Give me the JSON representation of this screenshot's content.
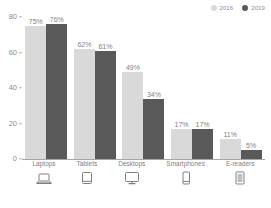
{
  "chart_data": {
    "type": "bar",
    "title": "",
    "xlabel": "",
    "ylabel": "",
    "ylim": [
      0,
      80
    ],
    "yticks": [
      0,
      20,
      40,
      60,
      80
    ],
    "grid": false,
    "legend_position": "top-right",
    "categories": [
      "Laptops",
      "Tablets",
      "Desktops",
      "Smartphones",
      "E-readers"
    ],
    "series": [
      {
        "name": "2016",
        "color": "#d9d9d9",
        "values": [
          75,
          62,
          49,
          17,
          11
        ],
        "labels": [
          "75%",
          "62%",
          "49%",
          "17%",
          "11%"
        ]
      },
      {
        "name": "2019",
        "color": "#595959",
        "values": [
          76,
          61,
          34,
          17,
          5
        ],
        "labels": [
          "76%",
          "61%",
          "34%",
          "17%",
          "5%"
        ]
      }
    ],
    "category_icons": [
      "laptop-icon",
      "tablet-icon",
      "desktop-monitor-icon",
      "smartphone-icon",
      "e-reader-icon"
    ]
  }
}
